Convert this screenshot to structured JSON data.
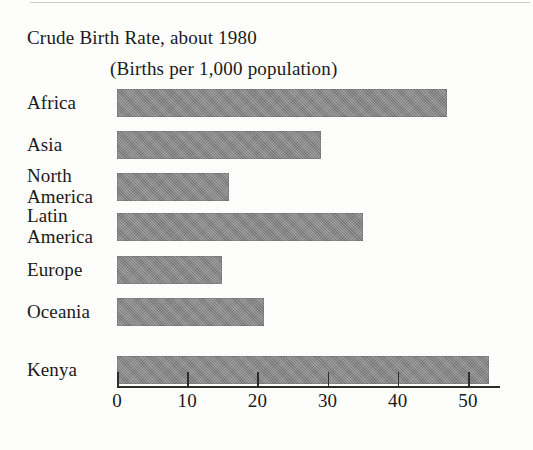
{
  "chart_data": {
    "type": "bar",
    "orientation": "horizontal",
    "title": "Crude Birth Rate, about 1980",
    "subtitle": "(Births per 1,000 population)",
    "xlabel": "",
    "ylabel": "",
    "categories": [
      "Africa",
      "Asia",
      "North\nAmerica",
      "Latin\nAmerica",
      "Europe",
      "Oceania",
      "Kenya"
    ],
    "values": [
      47,
      29,
      16,
      35,
      15,
      21,
      53
    ],
    "xlim": [
      0,
      55
    ],
    "xticks": [
      0,
      10,
      20,
      30,
      40,
      50
    ],
    "xtick_labels": [
      "0",
      "10",
      "20",
      "30",
      "40",
      "50"
    ],
    "grid": false,
    "legend": null,
    "bar_color": "#848484"
  },
  "axis": {
    "ticks": [
      {
        "label": "0",
        "value": 0
      },
      {
        "label": "10",
        "value": 10
      },
      {
        "label": "20",
        "value": 20
      },
      {
        "label": "30",
        "value": 30
      },
      {
        "label": "40",
        "value": 40
      },
      {
        "label": "50",
        "value": 50
      }
    ]
  },
  "rows": [
    {
      "label": "Africa",
      "value": 47
    },
    {
      "label": "Asia",
      "value": 29
    },
    {
      "label": "North\nAmerica",
      "value": 16
    },
    {
      "label": "Latin\nAmerica",
      "value": 35
    },
    {
      "label": "Europe",
      "value": 15
    },
    {
      "label": "Oceania",
      "value": 21
    },
    {
      "label": "Kenya",
      "value": 53
    }
  ]
}
